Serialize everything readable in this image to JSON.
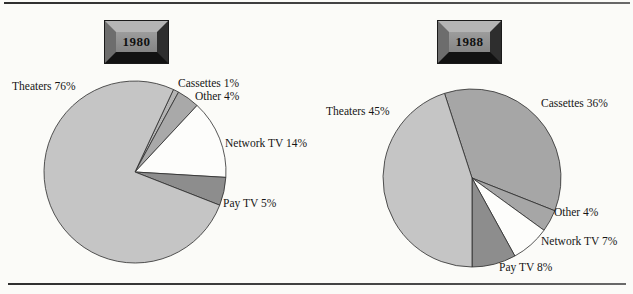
{
  "figure": {
    "background_color": "#fbfbf8",
    "rule_color": "#3e3e3e",
    "plaque": {
      "face_color": "#8f8f8f",
      "bevel_top": "#b5b5b5",
      "bevel_left": "#6d6d6d",
      "bevel_right": "#2e2e2e",
      "bevel_bottom": "#121212",
      "text_color": "#101010"
    }
  },
  "chart_data": [
    {
      "type": "pie",
      "title": "1980",
      "legend": "none",
      "start_angle_deg": 25,
      "center": {
        "x": 135,
        "y": 172
      },
      "radius": 91,
      "stroke_color": "#2c2c2c",
      "categories": [
        "Cassettes",
        "Other",
        "Network TV",
        "Pay TV",
        "Theaters"
      ],
      "values": [
        1,
        4,
        14,
        5,
        76
      ],
      "slices": [
        {
          "name": "Cassettes",
          "value_pct": 1,
          "label": "Cassettes 1%",
          "color": "#b4b4b4",
          "label_x": 178,
          "label_y": 77
        },
        {
          "name": "Other",
          "value_pct": 4,
          "label": "Other 4%",
          "color": "#a9a9a9",
          "label_x": 195,
          "label_y": 90
        },
        {
          "name": "Network TV",
          "value_pct": 14,
          "label": "Network TV 14%",
          "color": "#fdfdfb",
          "label_x": 225,
          "label_y": 137
        },
        {
          "name": "Pay TV",
          "value_pct": 5,
          "label": "Pay TV 5%",
          "color": "#8d8d8d",
          "label_x": 223,
          "label_y": 197
        },
        {
          "name": "Theaters",
          "value_pct": 76,
          "label": "Theaters 76%",
          "color": "#c5c5c5",
          "label_x": 12,
          "label_y": 80
        }
      ]
    },
    {
      "type": "pie",
      "title": "1988",
      "legend": "none",
      "start_angle_deg": -18,
      "center": {
        "x": 472,
        "y": 178
      },
      "radius": 89,
      "stroke_color": "#2c2c2c",
      "categories": [
        "Cassettes",
        "Other",
        "Network TV",
        "Pay TV",
        "Theaters"
      ],
      "values": [
        36,
        4,
        7,
        8,
        45
      ],
      "slices": [
        {
          "name": "Cassettes",
          "value_pct": 36,
          "label": "Cassettes 36%",
          "color": "#a6a6a6",
          "label_x": 541,
          "label_y": 97
        },
        {
          "name": "Other",
          "value_pct": 4,
          "label": "Other 4%",
          "color": "#a6a6a6",
          "label_x": 554,
          "label_y": 206
        },
        {
          "name": "Network TV",
          "value_pct": 7,
          "label": "Network TV 7%",
          "color": "#fdfdfb",
          "label_x": 541,
          "label_y": 235
        },
        {
          "name": "Pay TV",
          "value_pct": 8,
          "label": "Pay TV 8%",
          "color": "#8d8d8d",
          "label_x": 499,
          "label_y": 261
        },
        {
          "name": "Theaters",
          "value_pct": 45,
          "label": "Theaters 45%",
          "color": "#c5c5c5",
          "label_x": 326,
          "label_y": 105
        }
      ]
    }
  ]
}
